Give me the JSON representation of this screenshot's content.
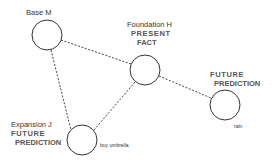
{
  "nodes": [
    {
      "id": "base",
      "title": "Base  M",
      "cx": 47,
      "cy": 35,
      "r": 15
    },
    {
      "id": "foundation",
      "title": "Foundation  H",
      "line2": "PRESENT",
      "line3": "FACT",
      "cx": 145,
      "cy": 70,
      "r": 15
    },
    {
      "id": "future-right",
      "line1": "FUTURE",
      "line2": "PREDICTION",
      "caption": "rain",
      "cx": 225,
      "cy": 105,
      "r": 15
    },
    {
      "id": "expansion",
      "title": "Expansion J",
      "line2": "FUTURE",
      "line3": "PREDICTION",
      "caption": "buy umbrella",
      "cx": 82,
      "cy": 140,
      "r": 15
    }
  ],
  "edges": [
    {
      "from": "base",
      "to": "foundation"
    },
    {
      "from": "base",
      "to": "expansion"
    },
    {
      "from": "foundation",
      "to": "expansion"
    },
    {
      "from": "foundation",
      "to": "future-right"
    }
  ],
  "colors": {
    "stroke": "#333333",
    "background": "#ffffff"
  }
}
